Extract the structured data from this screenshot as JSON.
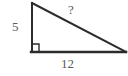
{
  "figure": {
    "kind": "right-triangle-diagram",
    "background_color": "#ffffff",
    "stroke_color": "#2b2b2b",
    "text_color": "#5a5a5a",
    "stroke_width": 2,
    "vertices": {
      "top": {
        "x": 31,
        "y": 3
      },
      "bottom_left": {
        "x": 31,
        "y": 52
      },
      "bottom_right": {
        "x": 126,
        "y": 52
      }
    },
    "right_angle_marker": {
      "present": true,
      "at_vertex": "bottom_left",
      "size": 7
    },
    "labels": {
      "leg_vertical": "5",
      "hypotenuse": "?",
      "leg_horizontal": "12"
    }
  }
}
